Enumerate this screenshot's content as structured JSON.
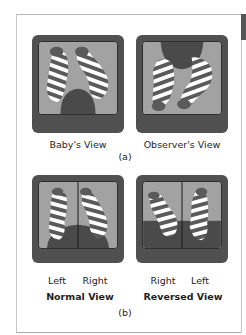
{
  "figure": {
    "part_a": {
      "panels": [
        {
          "label": "Baby's View",
          "icon": "baby-legs-view-illustration"
        },
        {
          "label": "Observer's View",
          "icon": "observer-legs-view-illustration"
        }
      ],
      "caption": "(a)"
    },
    "part_b": {
      "panels": [
        {
          "title": "Normal View",
          "left_label": "Left",
          "right_label": "Right",
          "icon": "normal-split-view-illustration"
        },
        {
          "title": "Reversed View",
          "left_label": "Right",
          "right_label": "Left",
          "icon": "reversed-split-view-illustration"
        }
      ],
      "caption": "(b)"
    }
  },
  "colors": {
    "frame": "#505050",
    "screen": "#9c9c9c",
    "leg_dark": "#5a5a5a",
    "stripe_light": "#ffffff",
    "body_dark": "#4a4a4a"
  }
}
